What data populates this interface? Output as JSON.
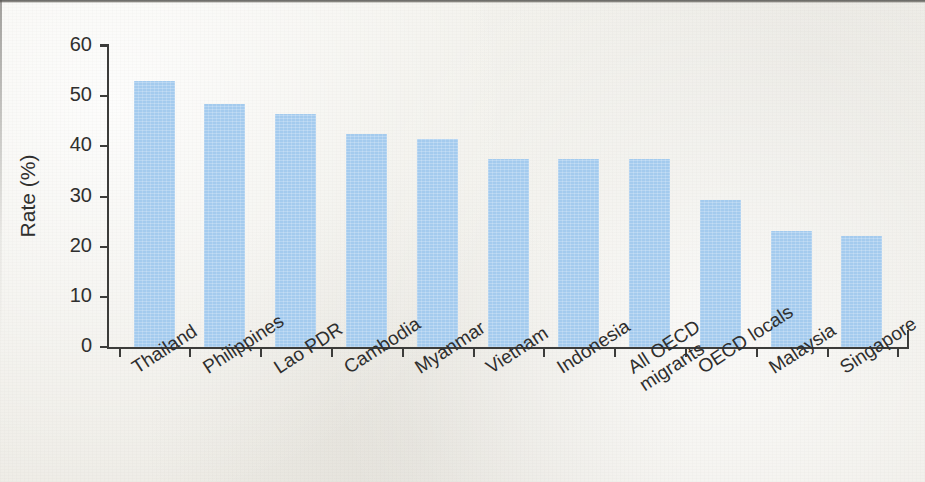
{
  "chart_data": {
    "type": "bar",
    "title": "",
    "subtitle": "",
    "xlabel": "",
    "ylabel": "Rate (%)",
    "ylim": [
      0,
      60
    ],
    "yticks": [
      0,
      10,
      20,
      30,
      40,
      50,
      60
    ],
    "grid": false,
    "legend": null,
    "bar_color": "#a4cbee",
    "axis_color": "#3c3c3a",
    "categories": [
      "Thailand",
      "Philippines",
      "Lao PDR",
      "Cambodia",
      "Myanmar",
      "Vietnam",
      "Indonesia",
      "All OECD migrants",
      "OECD locals",
      "Malaysia",
      "Singapore"
    ],
    "category_lines": [
      [
        "Thailand"
      ],
      [
        "Philippines"
      ],
      [
        "Lao PDR"
      ],
      [
        "Cambodia"
      ],
      [
        "Myanmar"
      ],
      [
        "Vietnam"
      ],
      [
        "Indonesia"
      ],
      [
        "All OECD",
        "migrants"
      ],
      [
        "OECD locals"
      ],
      [
        "Malaysia"
      ],
      [
        "Singapore"
      ]
    ],
    "values": [
      53.0,
      48.5,
      46.5,
      42.5,
      41.5,
      37.5,
      37.5,
      37.5,
      29.3,
      23.2,
      22.1
    ]
  },
  "axis": {
    "y_tick_labels": [
      "0",
      "10",
      "20",
      "30",
      "40",
      "50",
      "60"
    ],
    "y_axis_title": "Rate (%)"
  }
}
